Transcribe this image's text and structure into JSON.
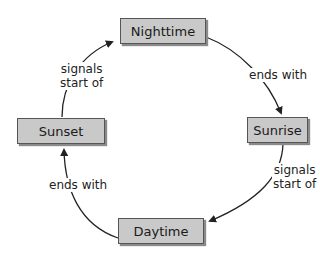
{
  "diagram": {
    "type": "cycle",
    "nodes": [
      {
        "id": "nighttime",
        "label": "Nighttime"
      },
      {
        "id": "sunrise",
        "label": "Sunrise"
      },
      {
        "id": "daytime",
        "label": "Daytime"
      },
      {
        "id": "sunset",
        "label": "Sunset"
      }
    ],
    "edges": [
      {
        "from": "nighttime",
        "to": "sunrise",
        "label": "ends with"
      },
      {
        "from": "sunrise",
        "to": "daytime",
        "label_line1": "signals",
        "label_line2": "start of"
      },
      {
        "from": "daytime",
        "to": "sunset",
        "label": "ends with"
      },
      {
        "from": "sunset",
        "to": "nighttime",
        "label_line1": "signals",
        "label_line2": "start of"
      }
    ],
    "colors": {
      "node_fill": "#c9c9c9",
      "node_border": "#555555",
      "edge": "#222222"
    }
  }
}
